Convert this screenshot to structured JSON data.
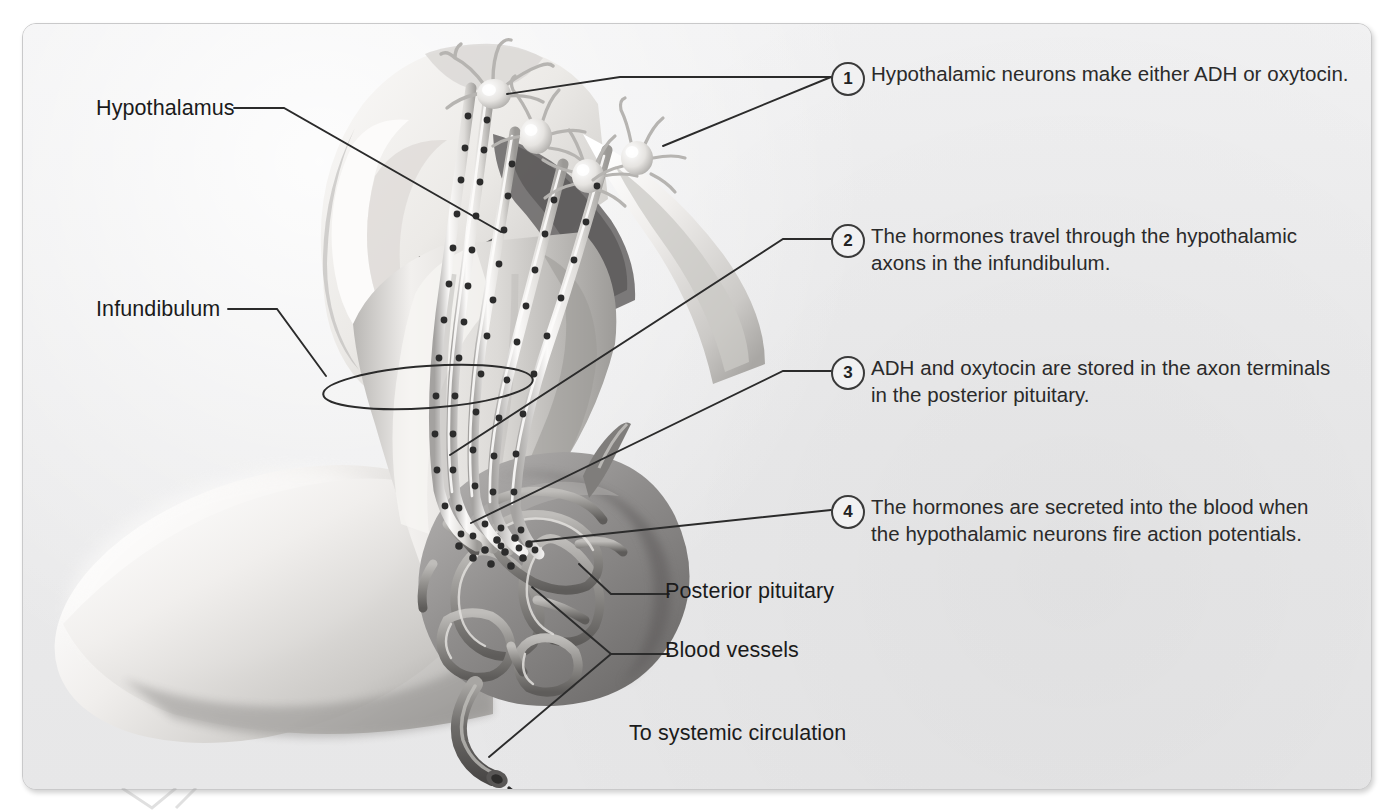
{
  "figure": {
    "style": "grayscale anatomical illustration on light gray rounded panel",
    "background_color": "#ececed",
    "text_color": "#1b1b1b",
    "line_color": "#2b2b2b"
  },
  "anatomy_labels": [
    {
      "id": "hypothalamus",
      "text": "Hypothalamus",
      "x": 95,
      "y": 95
    },
    {
      "id": "infundibulum",
      "text": "Infundibulum",
      "x": 95,
      "y": 296
    },
    {
      "id": "posterior-pituitary",
      "text": "Posterior pituitary",
      "x": 664,
      "y": 578
    },
    {
      "id": "blood-vessels",
      "text": "Blood vessels",
      "x": 664,
      "y": 637
    },
    {
      "id": "systemic-circulation",
      "text": "To systemic circulation",
      "x": 628,
      "y": 720
    }
  ],
  "steps": [
    {
      "number": "1",
      "text": "Hypothalamic neurons make either ADH or oxytocin.",
      "circle_x": 830,
      "circle_y": 61,
      "text_x": 870,
      "text_y": 58
    },
    {
      "number": "2",
      "text": "The hormones travel through the hypothalamic\naxons in the infundibulum.",
      "circle_x": 830,
      "circle_y": 223,
      "text_x": 870,
      "text_y": 220
    },
    {
      "number": "3",
      "text": "ADH and oxytocin are stored in the axon terminals\nin the posterior pituitary.",
      "circle_x": 830,
      "circle_y": 355,
      "text_x": 870,
      "text_y": 352
    },
    {
      "number": "4",
      "text": "The hormones are secreted into the blood when\nthe hypothalamic neurons fire action potentials.",
      "circle_x": 830,
      "circle_y": 494,
      "text_x": 870,
      "text_y": 491
    }
  ],
  "diagram_elements": {
    "neuron_count": 4,
    "neuron_label": "hypothalamic neurosecretory neuron",
    "axon_bundle_label": "hypothalamic axon bundle in infundibulum",
    "granule_label": "hormone-filled secretory granule",
    "capillary_network_label": "capillary plexus of posterior pituitary",
    "efferent_vein_label": "hypophyseal vein to systemic circulation",
    "infundibulum_ring_label": "infundibulum encircling marker"
  },
  "colors": {
    "tissue_light": "#f4f3f1",
    "tissue_mid": "#c6c5c3",
    "tissue_dark": "#8e8d8c",
    "cavity_dark": "#6d6c6b",
    "granule": "#2c2c2c",
    "vessel": "#9a9997",
    "vessel_dark": "#5f5e5d"
  }
}
